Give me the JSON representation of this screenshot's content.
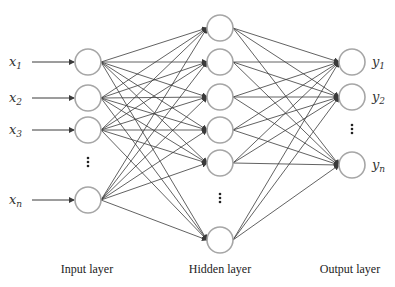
{
  "diagram": {
    "type": "feedforward-neural-network",
    "colors": {
      "edge": "#3a3a3a",
      "node_stroke": "#a6a6a6",
      "node_fill": "#ffffff",
      "text": "#222222"
    },
    "node_radius": 13,
    "layers": [
      {
        "id": "input",
        "label": "Input layer",
        "label_pos": [
          87,
          273
        ],
        "x": 88,
        "nodes": [
          62,
          98,
          130,
          200
        ],
        "ellipsis_y": 162,
        "inputs": [
          {
            "base": "x",
            "sub": "1",
            "y": 62
          },
          {
            "base": "x",
            "sub": "2",
            "y": 98
          },
          {
            "base": "x",
            "sub": "3",
            "y": 130
          },
          {
            "base": "x",
            "sub": "n",
            "y": 200
          }
        ]
      },
      {
        "id": "hidden",
        "label": "Hidden layer",
        "label_pos": [
          220,
          273
        ],
        "x": 220,
        "nodes": [
          28,
          62,
          97,
          130,
          163,
          240
        ],
        "ellipsis_y": 198
      },
      {
        "id": "output",
        "label": "Output layer",
        "label_pos": [
          350,
          273
        ],
        "x": 352,
        "nodes": [
          62,
          97,
          165
        ],
        "ellipsis_y": 129,
        "outputs": [
          {
            "base": "y",
            "sub": "1",
            "y": 62
          },
          {
            "base": "y",
            "sub": "2",
            "y": 97
          },
          {
            "base": "y",
            "sub": "n",
            "y": 165
          }
        ]
      }
    ]
  }
}
